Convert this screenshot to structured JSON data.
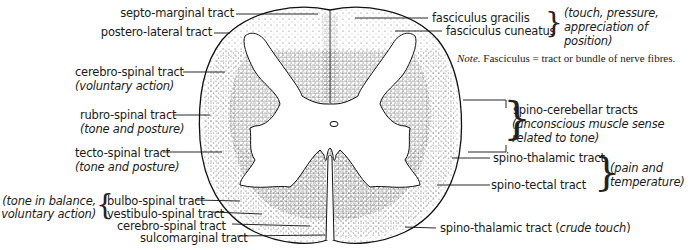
{
  "figure": {
    "type": "spinal-cord-cross-section",
    "labels_left": [
      {
        "id": "septo-marginal",
        "name": "septo-marginal tract",
        "function": ""
      },
      {
        "id": "postero-lateral",
        "name": "postero-lateral tract",
        "function": ""
      },
      {
        "id": "cerebro-spinal-lateral",
        "name": "cerebro-spinal tract",
        "function": "voluntary action"
      },
      {
        "id": "rubro-spinal",
        "name": "rubro-spinal tract",
        "function": "tone and posture"
      },
      {
        "id": "tecto-spinal",
        "name": "tecto-spinal tract",
        "function": "tone and posture"
      },
      {
        "id": "bulbo-spinal",
        "name": "bulbo-spinal tract",
        "function": ""
      },
      {
        "id": "vestibulo-spinal",
        "name": "vestibulo-spinal tract",
        "function": ""
      },
      {
        "id": "cerebro-spinal-anterior",
        "name": "cerebro-spinal tract",
        "function": ""
      },
      {
        "id": "sulcomarginal",
        "name": "sulcomarginal tract",
        "function": ""
      }
    ],
    "left_group_function": {
      "line1": "(tone in balance,",
      "line2": "voluntary action)"
    },
    "labels_right": [
      {
        "id": "fasciculus-gracilis",
        "name": "fasciculus gracilis"
      },
      {
        "id": "fasciculus-cuneatus",
        "name": "fasciculus cuneatus"
      },
      {
        "id": "spino-cerebellar",
        "name": "spino-cerebellar tracts"
      },
      {
        "id": "spino-thalamic-lateral",
        "name": "spino-thalamic tract"
      },
      {
        "id": "spino-tectal",
        "name": "spino-tectal tract"
      },
      {
        "id": "spino-thalamic-anterior",
        "name": "spino-thalamic tract",
        "function_prefix": "(",
        "function": "crude touch",
        "function_suffix": ")"
      }
    ],
    "posterior_group_function": {
      "line1": "(touch, pressure,",
      "line2": "appreciation of",
      "line3": "position)"
    },
    "spino_cerebellar_function": {
      "line1": "(unconscious muscle sense",
      "line2": "related to tone)"
    },
    "pain_group_function": {
      "line1": "(pain and",
      "line2": "temperature)"
    },
    "note": {
      "prefix": "Note.",
      "text": "Fasciculus = tract or bundle of nerve fibres."
    }
  }
}
